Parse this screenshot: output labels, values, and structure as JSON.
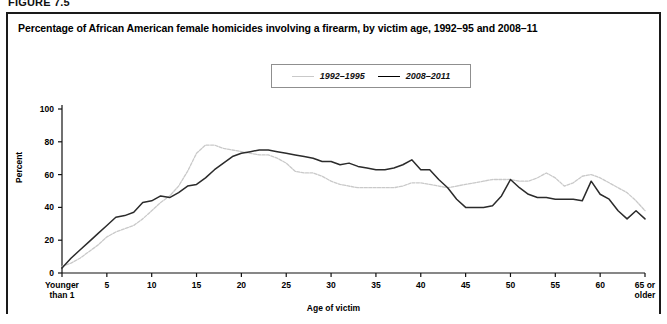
{
  "figure": {
    "label": "FIGURE 7.5",
    "title": "Percentage of African American female homicides involving a firearm, by victim age, 1992–95 and 2008–11"
  },
  "chart_data": {
    "type": "line",
    "title": "Percentage of African American female homicides involving a firearm, by victim age, 1992–95 and 2008–11",
    "xlabel": "Age of victim",
    "ylabel": "Percent",
    "ylim": [
      0,
      100
    ],
    "yticks": [
      0,
      20,
      40,
      60,
      80,
      100
    ],
    "xlim": [
      0,
      65
    ],
    "xticks": [
      0,
      5,
      10,
      15,
      20,
      25,
      30,
      35,
      40,
      45,
      50,
      55,
      60,
      65
    ],
    "xticklabels": [
      "Younger\nthan 1",
      "5",
      "10",
      "15",
      "20",
      "25",
      "30",
      "35",
      "40",
      "45",
      "50",
      "55",
      "60",
      "65 or\nolder"
    ],
    "grid": false,
    "legend_position": "top-center",
    "x": [
      0,
      1,
      2,
      3,
      4,
      5,
      6,
      7,
      8,
      9,
      10,
      11,
      12,
      13,
      14,
      15,
      16,
      17,
      18,
      19,
      20,
      21,
      22,
      23,
      24,
      25,
      26,
      27,
      28,
      29,
      30,
      31,
      32,
      33,
      34,
      35,
      36,
      37,
      38,
      39,
      40,
      41,
      42,
      43,
      44,
      45,
      46,
      47,
      48,
      49,
      50,
      51,
      52,
      53,
      54,
      55,
      56,
      57,
      58,
      59,
      60,
      61,
      62,
      63,
      64,
      65
    ],
    "series": [
      {
        "name": "1992–1995",
        "color": "#c9c9c9",
        "style": "dotted",
        "values": [
          4,
          6,
          9,
          13,
          17,
          22,
          25,
          27,
          29,
          33,
          38,
          43,
          47,
          53,
          62,
          73,
          78,
          78,
          76,
          75,
          74,
          73,
          72,
          72,
          70,
          67,
          62,
          61,
          61,
          59,
          56,
          54,
          53,
          52,
          52,
          52,
          52,
          52,
          53,
          55,
          55,
          54,
          53,
          52,
          53,
          54,
          55,
          56,
          57,
          57,
          57,
          56,
          56,
          58,
          61,
          58,
          53,
          55,
          59,
          60,
          58,
          55,
          52,
          49,
          44,
          38
        ]
      },
      {
        "name": "2008–2011",
        "color": "#2b2b2b",
        "style": "solid",
        "values": [
          3,
          9,
          14,
          19,
          24,
          29,
          34,
          35,
          37,
          43,
          44,
          47,
          46,
          49,
          53,
          54,
          58,
          63,
          67,
          71,
          73,
          74,
          75,
          75,
          74,
          73,
          72,
          71,
          70,
          68,
          68,
          66,
          67,
          65,
          64,
          63,
          63,
          64,
          66,
          69,
          63,
          63,
          57,
          52,
          45,
          40,
          40,
          40,
          41,
          47,
          57,
          52,
          48,
          46,
          46,
          45,
          45,
          45,
          44,
          56,
          48,
          45,
          38,
          33,
          38,
          33
        ]
      }
    ]
  },
  "legend": {
    "items": [
      {
        "label": "1992–1995"
      },
      {
        "label": "2008–2011"
      }
    ]
  }
}
